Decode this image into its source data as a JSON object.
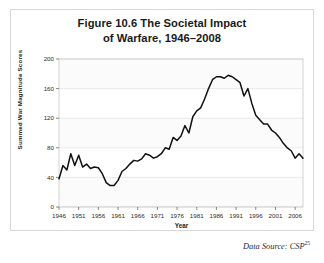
{
  "figure": {
    "title_line1": "Figure 10.6 The Societal Impact",
    "title_line2": "of Warfare, 1946–2008",
    "source_label": "Data Source: CSP",
    "source_superscript": "25"
  },
  "chart_data": {
    "type": "line",
    "title": "Figure 10.6 The Societal Impact of Warfare, 1946–2008",
    "xlabel": "Year",
    "ylabel": "Summed War Magnitude Scores",
    "xlim": [
      1946,
      2008
    ],
    "ylim": [
      0,
      200
    ],
    "yticks": [
      0,
      40,
      80,
      120,
      160,
      200
    ],
    "ytick_labels": [
      "0",
      "40",
      "80",
      "120",
      "160",
      "200"
    ],
    "xticks": [
      1946,
      1951,
      1956,
      1961,
      1966,
      1971,
      1976,
      1981,
      1986,
      1991,
      1996,
      2001,
      2006
    ],
    "xtick_labels": [
      "1946",
      "1951",
      "1956",
      "1961",
      "1966",
      "1971",
      "1976",
      "1981",
      "1986",
      "1991",
      "1996",
      "2001",
      "2006"
    ],
    "grid": true,
    "legend": false,
    "line_color": "#111111",
    "series": [
      {
        "name": "Summed War Magnitude Scores",
        "x": [
          1946,
          1947,
          1948,
          1949,
          1950,
          1951,
          1952,
          1953,
          1954,
          1955,
          1956,
          1957,
          1958,
          1959,
          1960,
          1961,
          1962,
          1963,
          1964,
          1965,
          1966,
          1967,
          1968,
          1969,
          1970,
          1971,
          1972,
          1973,
          1974,
          1975,
          1976,
          1977,
          1978,
          1979,
          1980,
          1981,
          1982,
          1983,
          1984,
          1985,
          1986,
          1987,
          1988,
          1989,
          1990,
          1991,
          1992,
          1993,
          1994,
          1995,
          1996,
          1997,
          1998,
          1999,
          2000,
          2001,
          2002,
          2003,
          2004,
          2005,
          2006,
          2007,
          2008
        ],
        "values": [
          38,
          56,
          50,
          72,
          56,
          70,
          54,
          58,
          52,
          54,
          53,
          45,
          33,
          29,
          29,
          36,
          48,
          52,
          58,
          63,
          62,
          65,
          72,
          70,
          66,
          68,
          72,
          80,
          78,
          94,
          90,
          96,
          110,
          100,
          122,
          130,
          134,
          146,
          160,
          172,
          176,
          176,
          174,
          178,
          176,
          172,
          168,
          150,
          160,
          140,
          124,
          118,
          112,
          112,
          104,
          100,
          94,
          86,
          80,
          76,
          66,
          72,
          66
        ]
      }
    ]
  }
}
